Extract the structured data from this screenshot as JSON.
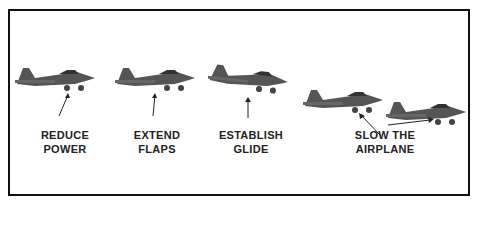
{
  "diagram": {
    "steps": [
      {
        "line1": "REDUCE",
        "line2": "POWER"
      },
      {
        "line1": "EXTEND",
        "line2": "FLAPS"
      },
      {
        "line1": "ESTABLISH",
        "line2": "GLIDE"
      },
      {
        "line1": "SLOW THE",
        "line2": "AIRPLANE"
      }
    ],
    "colors": {
      "border": "#111111",
      "airplane": "#555555",
      "text": "#222222"
    }
  }
}
